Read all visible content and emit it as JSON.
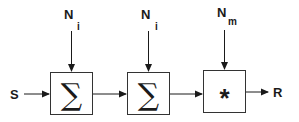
{
  "diagram": {
    "input": "S",
    "output": "R",
    "blocks": [
      {
        "symbol": "∑",
        "noise_label": "N",
        "noise_sub": "i"
      },
      {
        "symbol": "∑",
        "noise_label": "N",
        "noise_sub": "i"
      },
      {
        "symbol": "*",
        "noise_label": "N",
        "noise_sub": "m"
      }
    ],
    "colors": {
      "stroke": "#1a1a1a",
      "background": "#ffffff"
    }
  }
}
